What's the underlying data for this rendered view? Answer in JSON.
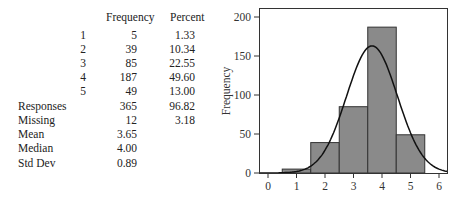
{
  "table": {
    "headers": {
      "frequency": "Frequency",
      "percent": "Percent"
    },
    "rows": [
      {
        "label": "1",
        "frequency": "5",
        "percent": "1.33"
      },
      {
        "label": "2",
        "frequency": "39",
        "percent": "10.34"
      },
      {
        "label": "3",
        "frequency": "85",
        "percent": "22.55"
      },
      {
        "label": "4",
        "frequency": "187",
        "percent": "49.60"
      },
      {
        "label": "5",
        "frequency": "49",
        "percent": "13.00"
      }
    ],
    "summary": [
      {
        "label": "Responses",
        "frequency": "365",
        "percent": "96.82"
      },
      {
        "label": "Missing",
        "frequency": "12",
        "percent": "3.18"
      },
      {
        "label": "Mean",
        "frequency": "3.65",
        "percent": ""
      },
      {
        "label": "Median",
        "frequency": "4.00",
        "percent": ""
      },
      {
        "label": "Std Dev",
        "frequency": "0.89",
        "percent": ""
      }
    ]
  },
  "chart_data": {
    "type": "bar",
    "title": "",
    "xlabel": "",
    "ylabel": "Frequency",
    "categories": [
      "1",
      "2",
      "3",
      "4",
      "5"
    ],
    "values": [
      5,
      39,
      85,
      187,
      49
    ],
    "bin_edges": [
      0.5,
      1.5,
      2.5,
      3.5,
      4.5,
      5.5
    ],
    "xticks": [
      "0",
      "1",
      "2",
      "3",
      "4",
      "5",
      "6"
    ],
    "yticks": [
      "0",
      "50",
      "100",
      "150",
      "200"
    ],
    "xlim": [
      -0.3,
      6.3
    ],
    "ylim": [
      0,
      210
    ],
    "overlay": {
      "type": "normal-curve",
      "mean": 3.65,
      "std": 0.89,
      "n": 365,
      "peak": 163
    },
    "grid": false,
    "legend": null,
    "bar_color": "#8a8a8a",
    "bar_edge_color": "#333333",
    "curve_color": "#111111"
  }
}
